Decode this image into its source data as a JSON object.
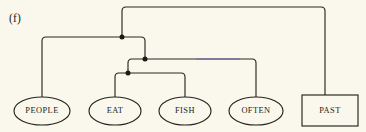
{
  "figure": {
    "panel_label": "(f)",
    "background_color": "#faf8ec",
    "ink_color": "#2a271f",
    "tint_color": "#6b6ab5",
    "width": 366,
    "height": 132
  },
  "nodes": [
    {
      "id": "people",
      "label": "PEOPLE",
      "shape": "ellipse",
      "cx": 42,
      "cy": 111,
      "rx": 28,
      "ry": 14
    },
    {
      "id": "eat",
      "label": "EAT",
      "shape": "ellipse",
      "cx": 115,
      "cy": 111,
      "rx": 26,
      "ry": 14
    },
    {
      "id": "fish",
      "label": "FISH",
      "shape": "ellipse",
      "cx": 185,
      "cy": 111,
      "rx": 26,
      "ry": 14
    },
    {
      "id": "often",
      "label": "OFTEN",
      "shape": "ellipse",
      "cx": 256,
      "cy": 111,
      "rx": 27,
      "ry": 14
    },
    {
      "id": "past",
      "label": "PAST",
      "shape": "rectangle",
      "x": 302,
      "y": 95,
      "w": 56,
      "h": 31,
      "cx": 330,
      "cy": 111
    }
  ],
  "junctions": [
    {
      "id": "j-top",
      "x": 122,
      "y": 37,
      "r": 2.5
    },
    {
      "id": "j-mid",
      "x": 145,
      "y": 59,
      "r": 2.5
    },
    {
      "id": "j-low",
      "x": 128,
      "y": 73,
      "r": 2.5
    }
  ],
  "edges": [
    {
      "id": "edge-root-past",
      "from": "j-top",
      "to": "past",
      "path": "M 122 37 L 122 11 Q 122 7 126 7 L 321 7 Q 325 7 325 11 L 325 95"
    },
    {
      "id": "edge-root-people",
      "from": "j-top",
      "to": "people",
      "path": "M 122 37 L 46 37 Q 42 37 42 41 L 42 97"
    },
    {
      "id": "edge-root-down",
      "from": "j-top",
      "to": "j-mid",
      "path": "M 122 37 L 141 37 Q 145 37 145 41 L 145 59"
    },
    {
      "id": "edge-mid-often",
      "from": "j-mid",
      "to": "often",
      "path": "M 145 59 L 252 59 Q 256 59 256 63 L 256 97",
      "tinted_segment": {
        "x1": 196,
        "x2": 240,
        "y": 59
      }
    },
    {
      "id": "edge-mid-down",
      "from": "j-mid",
      "to": "j-low",
      "path": "M 145 59 L 132 59 Q 128 59 128 63 L 128 73"
    },
    {
      "id": "edge-low-eat",
      "from": "j-low",
      "to": "eat",
      "path": "M 128 73 L 119 73 Q 115 73 115 77 L 115 97"
    },
    {
      "id": "edge-low-fish",
      "from": "j-low",
      "to": "fish",
      "path": "M 128 73 L 181 73 Q 185 73 185 77 L 185 97"
    }
  ]
}
